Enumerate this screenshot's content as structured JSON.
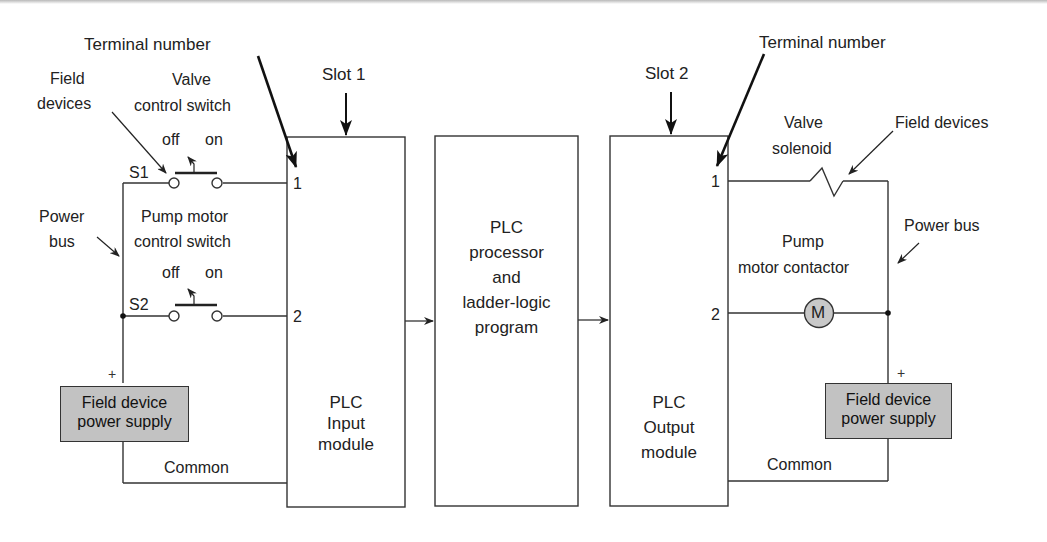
{
  "diagram": {
    "colors": {
      "line": "#333333",
      "power_supply_fill": "#c2c2c2",
      "motor_fill": "#c8c8c8",
      "background": "#ffffff"
    },
    "callouts": {
      "terminal_number_left": "Terminal number",
      "terminal_number_right": "Terminal number",
      "slot1": "Slot 1",
      "slot2": "Slot 2",
      "field_devices_left_line1": "Field",
      "field_devices_left_line2": "devices",
      "field_devices_right": "Field devices",
      "power_bus_left_line1": "Power",
      "power_bus_left_line2": "bus",
      "power_bus_right": "Power bus"
    },
    "input_side": {
      "valve_switch_line1": "Valve",
      "valve_switch_line2": "control switch",
      "s1_off": "off",
      "s1_on": "on",
      "s1_label": "S1",
      "pump_switch_line1": "Pump motor",
      "pump_switch_line2": "control switch",
      "s2_off": "off",
      "s2_on": "on",
      "s2_label": "S2",
      "power_supply_line1": "Field device",
      "power_supply_line2": "power supply",
      "plus": "+",
      "common": "Common"
    },
    "modules": {
      "input": {
        "line1": "PLC",
        "line2": "Input",
        "line3": "module",
        "terminal1": "1",
        "terminal2": "2"
      },
      "processor": {
        "line1": "PLC",
        "line2": "processor",
        "line3": "and",
        "line4": "ladder-logic",
        "line5": "program"
      },
      "output": {
        "line1": "PLC",
        "line2": "Output",
        "line3": "module",
        "terminal1": "1",
        "terminal2": "2"
      }
    },
    "output_side": {
      "valve_solenoid_line1": "Valve",
      "valve_solenoid_line2": "solenoid",
      "pump_contactor_line1": "Pump",
      "pump_contactor_line2": "motor contactor",
      "motor_symbol": "M",
      "power_supply_line1": "Field device",
      "power_supply_line2": "power supply",
      "plus": "+",
      "common": "Common"
    }
  }
}
